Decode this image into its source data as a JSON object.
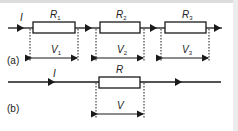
{
  "figure": {
    "background": "#ffffff",
    "line_color": "#1a1a1a",
    "border_color": "#d8d8d8",
    "panel_a": {
      "label": "(a)",
      "current_label": "I",
      "resistors": [
        {
          "name": "R",
          "sub": "1",
          "voltage": "V",
          "vsub": "1"
        },
        {
          "name": "R",
          "sub": "2",
          "voltage": "V",
          "vsub": "2"
        },
        {
          "name": "R",
          "sub": "3",
          "voltage": "V",
          "vsub": "3"
        }
      ]
    },
    "panel_b": {
      "label": "(b)",
      "current_label": "I",
      "resistor": {
        "name": "R",
        "voltage": "V"
      }
    }
  }
}
